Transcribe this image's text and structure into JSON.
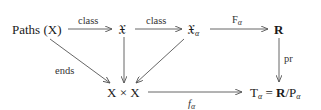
{
  "diagram": {
    "type": "commutative-diagram",
    "nodes": {
      "paths": {
        "label": "Paths (X)"
      },
      "frakX": {
        "label": "𝔛"
      },
      "frakX_alpha": {
        "label": "𝔛",
        "sub": "α"
      },
      "R": {
        "label": "R"
      },
      "XxX": {
        "label": "X × X"
      },
      "T_alpha_left": {
        "label": "T",
        "sub": "α"
      },
      "T_alpha_eq": {
        "label": " = "
      },
      "T_alpha_R": {
        "label": "R"
      },
      "T_alpha_slash": {
        "label": "/P"
      },
      "T_alpha_sub2": {
        "sub": "α"
      }
    },
    "edges": [
      {
        "from": "Paths (X)",
        "to": "𝔛",
        "label": "class"
      },
      {
        "from": "𝔛",
        "to": "𝔛α",
        "label": "class"
      },
      {
        "from": "𝔛α",
        "to": "R",
        "label": "F",
        "label_sub": "α"
      },
      {
        "from": "R",
        "to": "Tα",
        "label": "pr"
      },
      {
        "from": "Paths (X)",
        "to": "X × X",
        "label": "ends"
      },
      {
        "from": "𝔛",
        "to": "X × X",
        "label": ""
      },
      {
        "from": "𝔛α",
        "to": "X × X",
        "label": ""
      },
      {
        "from": "X × X",
        "to": "Tα",
        "label": "f",
        "label_sub": "α"
      }
    ],
    "edge_labels": {
      "class1": "class",
      "class2": "class",
      "F": "F",
      "F_sub": "α",
      "pr": "pr",
      "ends": "ends",
      "f": "f",
      "f_sub": "α"
    },
    "colors": {
      "ink": "#1a1a1a",
      "arrow": "#555555",
      "background": "#ffffff"
    }
  }
}
